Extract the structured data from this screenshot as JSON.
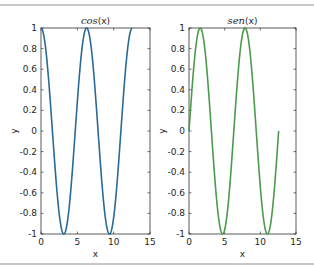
{
  "chart_data": [
    {
      "type": "line",
      "title": "cos(x)",
      "title_parts": {
        "func": "cos",
        "arg": "(x)"
      },
      "xlabel": "x",
      "ylabel": "y",
      "xlim": [
        0,
        15
      ],
      "ylim": [
        -1,
        1
      ],
      "xticks": [
        0,
        5,
        10,
        15
      ],
      "yticks": [
        -1,
        -0.8,
        -0.6,
        -0.4,
        -0.2,
        0,
        0.2,
        0.4,
        0.6,
        0.8,
        1
      ],
      "ytick_labels": [
        "-1",
        "-0.8",
        "-0.6",
        "-0.4",
        "-0.2",
        "0",
        "0.2",
        "0.4",
        "0.6",
        "0.8",
        "1"
      ],
      "grid": false,
      "series": [
        {
          "name": "cos(x)",
          "function": "cos",
          "x_range": [
            0,
            12.566
          ],
          "color": "#2a6a96"
        }
      ]
    },
    {
      "type": "line",
      "title": "sen(x)",
      "title_parts": {
        "func": "sen",
        "arg": "(x)"
      },
      "xlabel": "x",
      "ylabel": "y",
      "xlim": [
        0,
        15
      ],
      "ylim": [
        -1,
        1
      ],
      "xticks": [
        0,
        5,
        10,
        15
      ],
      "yticks": [
        -1,
        -0.8,
        -0.6,
        -0.4,
        -0.2,
        0,
        0.2,
        0.4,
        0.6,
        0.8,
        1
      ],
      "ytick_labels": [
        "-1",
        "-0.8",
        "-0.6",
        "-0.4",
        "-0.2",
        "0",
        "0.2",
        "0.4",
        "0.6",
        "0.8",
        "1"
      ],
      "grid": false,
      "series": [
        {
          "name": "sen(x)",
          "function": "sin",
          "x_range": [
            0,
            12.566
          ],
          "color": "#4c9a4c"
        }
      ]
    }
  ],
  "layout": {
    "axes": [
      {
        "left": 41,
        "top": 28,
        "width": 109,
        "height": 206
      },
      {
        "left": 189,
        "top": 28,
        "width": 107,
        "height": 206
      }
    ],
    "axis_color": "#333333"
  }
}
